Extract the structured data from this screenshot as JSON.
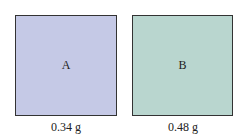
{
  "samples": [
    {
      "label": "A",
      "mass": "0.34 g",
      "color": "#c5c9e6"
    },
    {
      "label": "B",
      "mass": "0.48 g",
      "color": "#b9d6cf"
    }
  ]
}
